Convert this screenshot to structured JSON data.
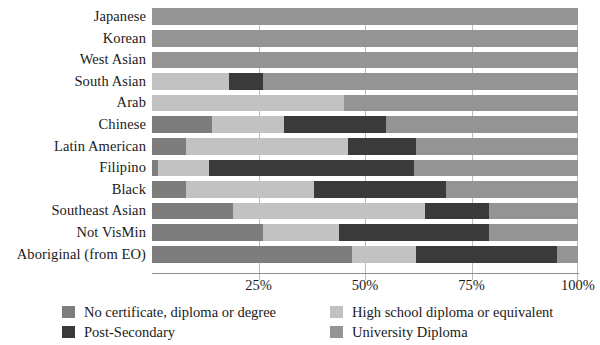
{
  "chart_data": {
    "type": "bar",
    "orientation": "horizontal",
    "stacked": true,
    "normalized": true,
    "title": "",
    "subtitle": "",
    "xlabel": "",
    "ylabel": "",
    "xlim": [
      0,
      100
    ],
    "xtick_labels": [
      "25%",
      "50%",
      "75%",
      "100%"
    ],
    "xtick_values": [
      25,
      50,
      75,
      100
    ],
    "grid": true,
    "legend_position": "bottom",
    "categories": [
      "Japanese",
      "Korean",
      "West Asian",
      "South Asian",
      "Arab",
      "Chinese",
      "Latin American",
      "Filipino",
      "Black",
      "Southeast Asian",
      "Not VisMin",
      "Aboriginal (from EO)"
    ],
    "series": [
      {
        "name": "No certificate, diploma or degree",
        "color": "#7d7d7d",
        "values": [
          0,
          0,
          0,
          0,
          0,
          14,
          8,
          1.5,
          8,
          19,
          26,
          47
        ]
      },
      {
        "name": "High school diploma or equivalent",
        "color": "#c2c2c2",
        "values": [
          0,
          0,
          0,
          18,
          45,
          17,
          38,
          12,
          30,
          45,
          18,
          15
        ]
      },
      {
        "name": "Post-Secondary",
        "color": "#3a3a3a",
        "values": [
          0,
          0,
          0,
          8,
          0,
          24,
          16,
          48,
          31,
          15,
          35,
          33
        ]
      },
      {
        "name": "University Diploma",
        "color": "#949494",
        "values": [
          100,
          100,
          100,
          74,
          55,
          45,
          38,
          38.5,
          31,
          21,
          21,
          5
        ]
      }
    ]
  },
  "legend": {
    "items": [
      {
        "label": "No certificate, diploma or degree",
        "color": "#7d7d7d"
      },
      {
        "label": "Post-Secondary",
        "color": "#3a3a3a"
      },
      {
        "label": "High school diploma or equivalent",
        "color": "#c2c2c2"
      },
      {
        "label": "University Diploma",
        "color": "#949494"
      }
    ]
  }
}
